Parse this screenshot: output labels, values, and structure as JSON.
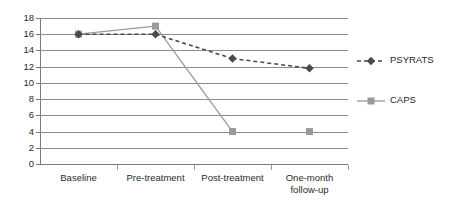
{
  "chart_data": {
    "type": "line",
    "title": "",
    "subtitle": "",
    "xlabel": "",
    "ylabel": "",
    "categories": [
      "Baseline",
      "Pre-treatment",
      "Post-treatment",
      "One-month follow-up"
    ],
    "series": [
      {
        "name": "PSYRATS",
        "values": [
          16,
          16,
          13,
          11.8
        ],
        "color": "#4a4a4a",
        "line_style": "dashed",
        "marker": "diamond"
      },
      {
        "name": "CAPS",
        "values": [
          16,
          17,
          4,
          4
        ],
        "color": "#9a9a9a",
        "line_style": "solid",
        "marker": "square"
      }
    ],
    "ylim": [
      0,
      18
    ],
    "y_ticks": [
      0,
      2,
      4,
      6,
      8,
      10,
      12,
      14,
      16,
      18
    ],
    "y_tick_labels": [
      "0",
      "2",
      "4",
      "6",
      "8",
      "10",
      "12",
      "14",
      "16",
      "18"
    ],
    "grid": true,
    "grid_axis": "y",
    "legend": true,
    "legend_position": "right",
    "legend_entries": [
      "PSYRATS",
      "CAPS"
    ]
  },
  "axis": {
    "y_labels": [
      "18",
      "16",
      "14",
      "12",
      "10",
      "8",
      "6",
      "4",
      "2",
      "0"
    ],
    "x_labels": [
      "Baseline",
      "Pre-treatment",
      "Post-treatment",
      "One-month follow-up"
    ]
  },
  "legend": {
    "items": [
      {
        "label": "PSYRATS"
      },
      {
        "label": "CAPS"
      }
    ]
  }
}
